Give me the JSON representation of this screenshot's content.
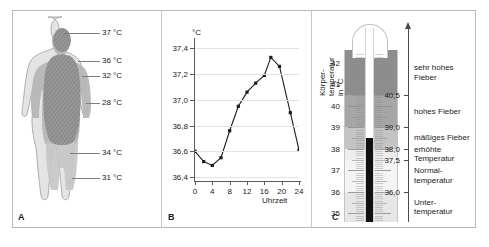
{
  "figure": {
    "panels": [
      {
        "letter": "A",
        "name": "body-temperature-zones"
      },
      {
        "letter": "B",
        "name": "circadian-temperature-curve"
      },
      {
        "letter": "C",
        "name": "clinical-thermometer-scale"
      }
    ]
  },
  "panelA": {
    "letter": "A",
    "labels": [
      {
        "text": "37 °C",
        "zone": "head-core"
      },
      {
        "text": "36 °C",
        "zone": "shoulder"
      },
      {
        "text": "32 °C",
        "zone": "upper-arm"
      },
      {
        "text": "28 °C",
        "zone": "forearm-hand"
      },
      {
        "text": "34 °C",
        "zone": "thigh"
      },
      {
        "text": "31 °C",
        "zone": "lower-leg"
      }
    ]
  },
  "panelB": {
    "letter": "B",
    "unit_label": "°C",
    "xtitle": "Uhrzeit"
  },
  "chart_data": {
    "type": "line",
    "title": "",
    "xlabel": "Uhrzeit",
    "ylabel": "°C",
    "ylim": [
      36.4,
      37.45
    ],
    "xlim": [
      0,
      24
    ],
    "grid": true,
    "legend": "none",
    "yticks": [
      "36,4",
      "36,6",
      "36,8",
      "37,0",
      "37,2",
      "37,4"
    ],
    "ytick_values": [
      36.4,
      36.6,
      36.8,
      37.0,
      37.2,
      37.4
    ],
    "xticks": [
      "0",
      "4",
      "8",
      "12",
      "16",
      "20",
      "24"
    ],
    "xtick_values": [
      0,
      4,
      8,
      12,
      16,
      20,
      24
    ],
    "x": [
      0,
      2,
      4,
      6,
      8,
      10,
      12,
      14,
      16,
      17.5,
      19.5,
      22,
      24
    ],
    "values": [
      36.6,
      36.52,
      36.49,
      36.55,
      36.76,
      36.95,
      37.06,
      37.13,
      37.19,
      37.33,
      37.26,
      36.9,
      36.61
    ]
  },
  "panelC": {
    "letter": "C",
    "vertical_title": "Körper-\ntemperatur\nin °C",
    "scale_numbers": [
      "42",
      "41",
      "40",
      "39",
      "38",
      "37",
      "36",
      "35"
    ],
    "scale_values": [
      42,
      41,
      40,
      39,
      38,
      37,
      36,
      35
    ],
    "mercury_reading": 38.5,
    "boundaries": [
      {
        "label": "40,5",
        "value": 40.5
      },
      {
        "label": "39,0",
        "value": 39.0
      },
      {
        "label": "38,0",
        "value": 38.0
      },
      {
        "label": "37,5",
        "value": 37.5
      },
      {
        "label": "36,0",
        "value": 36.0
      }
    ],
    "categories": [
      {
        "text": "sehr hohes\nFieber",
        "from": 40.5,
        "to": 42.6
      },
      {
        "text": "hohes Fieber",
        "from": 39.0,
        "to": 40.5
      },
      {
        "text": "mäßiges Fieber",
        "from": 38.0,
        "to": 39.0
      },
      {
        "text": "erhöhte\nTemperatur",
        "from": 37.5,
        "to": 38.0
      },
      {
        "text": "Normal-\ntemperatur",
        "from": 36.0,
        "to": 37.5
      },
      {
        "text": "Unter-\ntemperatur",
        "from": 34.6,
        "to": 36.0
      }
    ]
  },
  "colors": {
    "frame": "#b9b9b9",
    "axis": "#5a5a5a",
    "grid": "#e2e2e2",
    "line": "#1a1a1a",
    "mercury": "#111111",
    "band_very_high": "#8d8d8d",
    "band_high": "#a6a6a6",
    "band_moderate": "#c4c4c4",
    "band_elevated": "#ededed",
    "band_normal": "#f4f4f4",
    "band_low": "#e6e6e6",
    "core_dark": "#8a8a8a",
    "core_mid": "#b4b4b4",
    "core_light": "#d8d8d8"
  }
}
